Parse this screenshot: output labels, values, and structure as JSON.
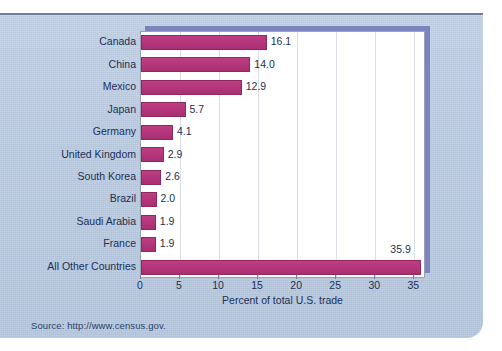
{
  "figure": {
    "source_note": "Source: http://www.census.gov.",
    "panel_color": "#bdcde3",
    "plot_background": "#ffffff",
    "bar_color": "#b3367a",
    "shadow_color": "#7b84bd",
    "text_color": "#1d3054",
    "gridline_color": "#d9dde6"
  },
  "chart_data": {
    "type": "bar",
    "orientation": "horizontal",
    "title": "",
    "subtitle": "",
    "xlabel": "Percent of total U.S. trade",
    "ylabel": "",
    "xlim": [
      0,
      36.5
    ],
    "xticks": [
      0,
      5,
      10,
      15,
      20,
      25,
      30,
      35
    ],
    "xticklabels": [
      "0",
      "5",
      "10",
      "15",
      "20",
      "25",
      "30",
      "35"
    ],
    "grid": "vertical",
    "legend": "none",
    "categories": [
      "Canada",
      "China",
      "Mexico",
      "Japan",
      "Germany",
      "United Kingdom",
      "South Korea",
      "Brazil",
      "Saudi Arabia",
      "France",
      "All Other Countries"
    ],
    "values": [
      16.1,
      14.0,
      12.9,
      5.7,
      4.1,
      2.9,
      2.6,
      2.0,
      1.9,
      1.9,
      35.9
    ],
    "value_labels": [
      "16.1",
      "14.0",
      "12.9",
      "5.7",
      "4.1",
      "2.9",
      "2.6",
      "2.0",
      "1.9",
      "1.9",
      "35.9"
    ]
  }
}
